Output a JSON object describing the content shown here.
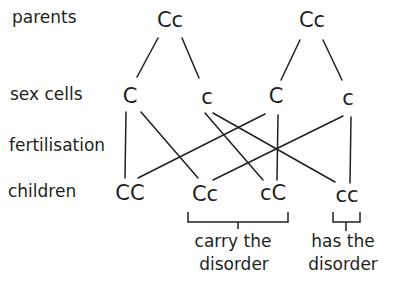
{
  "row_labels": {
    "parents": "parents",
    "sex_cells": "sex cells",
    "fertilisation": "fertilisation",
    "children": "children"
  },
  "parents": [
    {
      "genotype": "Cc"
    },
    {
      "genotype": "Cc"
    }
  ],
  "sex_cells": [
    {
      "allele": "C"
    },
    {
      "allele": "c"
    },
    {
      "allele": "C"
    },
    {
      "allele": "c"
    }
  ],
  "children": [
    {
      "genotype": "CC"
    },
    {
      "genotype": "Cc"
    },
    {
      "genotype": "cC"
    },
    {
      "genotype": "cc"
    }
  ],
  "annotations": {
    "carriers": {
      "line1": "carry the",
      "line2": "disorder"
    },
    "affected": {
      "line1": "has the",
      "line2": "disorder"
    }
  },
  "colors": {
    "ink": "#231f20",
    "background": "#ffffff"
  }
}
